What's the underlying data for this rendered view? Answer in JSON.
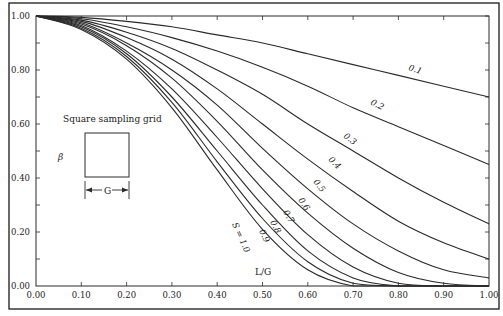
{
  "chart_data": {
    "type": "line",
    "title": "",
    "xlabel": "L/G",
    "ylabel": "β",
    "xlim": [
      0.0,
      1.0
    ],
    "ylim": [
      0.0,
      1.0
    ],
    "grid": false,
    "legend": "inline curve labels",
    "x_ticks": [
      "0.00",
      "0.10",
      "0.20",
      "0.30",
      "0.40",
      "0.50",
      "0.60",
      "0.70",
      "0.80",
      "0.90",
      "1.00"
    ],
    "y_ticks": [
      "0.00",
      "0.20",
      "0.40",
      "0.60",
      "0.80",
      "1.00"
    ],
    "x": [
      0.0,
      0.1,
      0.2,
      0.3,
      0.4,
      0.5,
      0.6,
      0.7,
      0.8,
      0.9,
      1.0
    ],
    "series": [
      {
        "name": "0.1",
        "label": "0.1",
        "values": [
          1.0,
          0.995,
          0.98,
          0.96,
          0.93,
          0.9,
          0.86,
          0.82,
          0.78,
          0.74,
          0.7
        ]
      },
      {
        "name": "0.2",
        "label": "0.2",
        "values": [
          1.0,
          0.99,
          0.96,
          0.92,
          0.87,
          0.81,
          0.74,
          0.66,
          0.59,
          0.52,
          0.45
        ]
      },
      {
        "name": "0.3",
        "label": "0.3",
        "values": [
          1.0,
          0.985,
          0.94,
          0.88,
          0.8,
          0.71,
          0.6,
          0.5,
          0.4,
          0.31,
          0.23
        ]
      },
      {
        "name": "0.4",
        "label": "0.4",
        "values": [
          1.0,
          0.98,
          0.92,
          0.84,
          0.73,
          0.6,
          0.47,
          0.35,
          0.24,
          0.16,
          0.1
        ]
      },
      {
        "name": "0.5",
        "label": "0.5",
        "values": [
          1.0,
          0.975,
          0.9,
          0.8,
          0.67,
          0.51,
          0.36,
          0.23,
          0.13,
          0.06,
          0.03
        ]
      },
      {
        "name": "0.6",
        "label": "0.6",
        "values": [
          1.0,
          0.97,
          0.89,
          0.77,
          0.61,
          0.43,
          0.27,
          0.14,
          0.05,
          0.01,
          0.0
        ]
      },
      {
        "name": "0.7",
        "label": "0.7",
        "values": [
          1.0,
          0.965,
          0.87,
          0.73,
          0.55,
          0.36,
          0.19,
          0.07,
          0.01,
          0.0,
          0.0
        ]
      },
      {
        "name": "0.8",
        "label": "0.8",
        "values": [
          1.0,
          0.96,
          0.86,
          0.7,
          0.5,
          0.3,
          0.13,
          0.03,
          0.0,
          0.0,
          0.0
        ]
      },
      {
        "name": "0.9",
        "label": "0.9",
        "values": [
          1.0,
          0.955,
          0.85,
          0.68,
          0.46,
          0.25,
          0.09,
          0.01,
          0.0,
          0.0,
          0.0
        ]
      },
      {
        "name": "S = 1.0",
        "label": "S = 1.0",
        "values": [
          1.0,
          0.95,
          0.84,
          0.66,
          0.43,
          0.21,
          0.06,
          0.0,
          0.0,
          0.0,
          0.0
        ]
      }
    ],
    "annotations": [
      {
        "text": "Square sampling grid",
        "type": "inset-caption"
      },
      {
        "text": "G",
        "type": "dimension-label"
      }
    ]
  },
  "labels": {
    "ylabel": "β",
    "xlabel": "L/G",
    "inset_caption": "Square sampling grid",
    "inset_dimension": "G"
  },
  "colors": {
    "line": "#2a2a2a",
    "frame": "#1a1a1a",
    "background": "#ffffff"
  }
}
